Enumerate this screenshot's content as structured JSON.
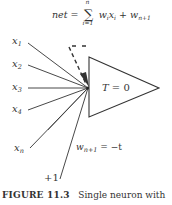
{
  "formula": {
    "lhs": "net",
    "equals": "=",
    "sum_symbol": "∑",
    "sum_upper": "n",
    "sum_lower": "i=1",
    "term_w": "w",
    "term_w_sub": "i",
    "term_x": "x",
    "term_x_sub": "i",
    "plus": "+",
    "bias_w": "w",
    "bias_w_sub": "n+1"
  },
  "neuron": {
    "label_var": "T",
    "label_rest": " = 0"
  },
  "inputs": [
    {
      "name": "x",
      "sub": "1"
    },
    {
      "name": "x",
      "sub": "2"
    },
    {
      "name": "x",
      "sub": "3"
    },
    {
      "name": "x",
      "sub": "4"
    },
    {
      "name": "x",
      "sub": "n"
    }
  ],
  "bias": {
    "input_label": "+1",
    "weight_w": "w",
    "weight_sub": "n+1",
    "weight_rest": " = −t"
  },
  "caption": {
    "figure_label": "FIGURE 11.3",
    "text": "Single neuron with"
  },
  "colors": {
    "line": "#333333",
    "text": "#333333",
    "background": "#ffffff"
  }
}
